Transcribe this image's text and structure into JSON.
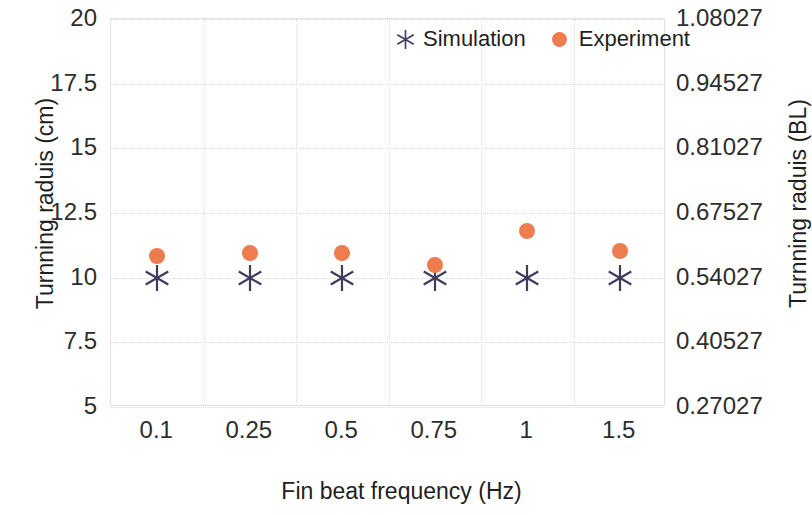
{
  "chart_data": {
    "type": "scatter",
    "title": "",
    "xlabel": "Fin beat frequency (Hz)",
    "ylabel": "Turnning raduis (cm)",
    "ylabel_secondary": "Turnning raduis (BL)",
    "categories": [
      "0.1",
      "0.25",
      "0.5",
      "0.75",
      "1",
      "1.5"
    ],
    "ylim": [
      5,
      20
    ],
    "yticks": [
      "5",
      "7.5",
      "10",
      "12.5",
      "15",
      "17.5",
      "20"
    ],
    "ytick_values": [
      5,
      7.5,
      10,
      12.5,
      15,
      17.5,
      20
    ],
    "ylim_secondary": [
      0.27027,
      1.08027
    ],
    "yticks_secondary": [
      "0.27027",
      "0.40527",
      "0.54027",
      "0.67527",
      "0.81027",
      "0.94527",
      "1.08027"
    ],
    "ytick_secondary_values": [
      0.27027,
      0.40527,
      0.54027,
      0.67527,
      0.81027,
      0.94527,
      1.08027
    ],
    "grid": true,
    "legend_position": "top-center-right-inside",
    "series": [
      {
        "name": "Simulation",
        "marker": "asterisk",
        "color": "#3d3d5c",
        "values": [
          10.0,
          10.0,
          10.0,
          10.0,
          10.0,
          10.0
        ]
      },
      {
        "name": "Experiment",
        "marker": "circle",
        "color": "#ed7d4e",
        "values": [
          10.85,
          10.95,
          10.95,
          10.5,
          11.8,
          11.05
        ]
      }
    ]
  },
  "colors": {
    "simulation": "#3d3d5c",
    "experiment": "#ed7d4e",
    "grid": "#dcdcdf",
    "axis_text": "#2d2d2d",
    "background": "#ffffff"
  }
}
